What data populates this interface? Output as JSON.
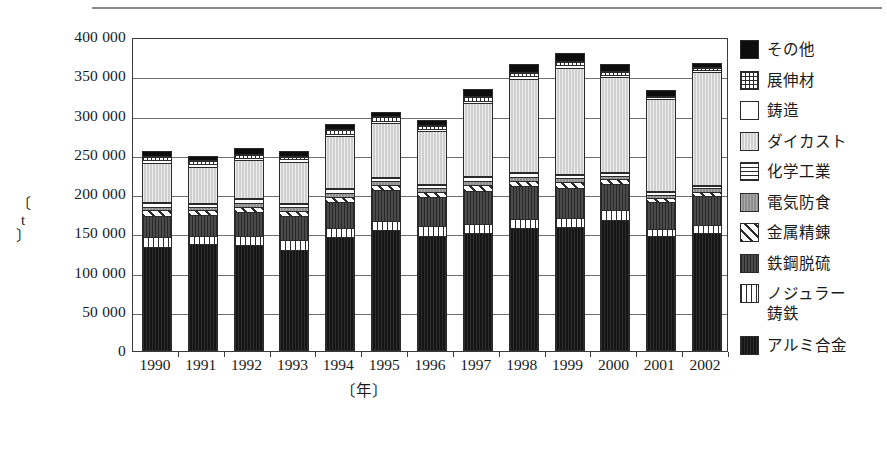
{
  "chart_data": {
    "type": "bar",
    "stacked": true,
    "title": "",
    "xlabel": "〔年〕",
    "ylabel": "〔t〕",
    "ylim": [
      0,
      400000
    ],
    "ytick_step": 50000,
    "ytick_labels": [
      "400 000",
      "350 000",
      "300 000",
      "250 000",
      "200 000",
      "150 000",
      "100 000",
      "50 000",
      "0"
    ],
    "ytick_values": [
      400000,
      350000,
      300000,
      250000,
      200000,
      150000,
      100000,
      50000,
      0
    ],
    "grid": true,
    "legend_position": "right",
    "categories": [
      "1990",
      "1991",
      "1992",
      "1993",
      "1994",
      "1995",
      "1996",
      "1997",
      "1998",
      "1999",
      "2000",
      "2001",
      "2002"
    ],
    "series": [
      {
        "name": "アルミ合金",
        "key": "alu",
        "fill": "f-alu",
        "color": "#151515",
        "values": [
          133000,
          136000,
          135000,
          129000,
          145000,
          154000,
          147000,
          150000,
          156000,
          158000,
          167000,
          147000,
          150000
        ]
      },
      {
        "name": "ノジュラー鋳鉄",
        "key": "nodular",
        "fill": "f-nodular",
        "color": "#ffffff",
        "values": [
          12000,
          11000,
          12000,
          12000,
          12000,
          12000,
          12000,
          12000,
          12000,
          12000,
          12000,
          9000,
          10000
        ]
      },
      {
        "name": "鉄鋼脱硫",
        "key": "desulf",
        "fill": "f-desulf",
        "color": "#4a4a4a",
        "values": [
          27000,
          26000,
          30000,
          31000,
          33000,
          39000,
          37000,
          42000,
          42000,
          38000,
          34000,
          34000,
          38000
        ]
      },
      {
        "name": "金属精錬",
        "key": "refine",
        "fill": "f-refine",
        "color": "#ffffff",
        "values": [
          7000,
          7000,
          7000,
          6000,
          6000,
          6000,
          6000,
          8000,
          7000,
          7000,
          6000,
          5000,
          5000
        ]
      },
      {
        "name": "電気防食",
        "key": "anticorr",
        "fill": "f-anticorr",
        "color": "#8e8e8e",
        "values": [
          5000,
          4000,
          5000,
          5000,
          5000,
          5000,
          5000,
          5000,
          5000,
          5000,
          4000,
          4000,
          4000
        ]
      },
      {
        "name": "化学工業",
        "key": "chem",
        "fill": "f-chem",
        "color": "#ffffff",
        "values": [
          6000,
          5000,
          6000,
          6000,
          6000,
          6000,
          6000,
          6000,
          6000,
          6000,
          5000,
          5000,
          5000
        ]
      },
      {
        "name": "ダイカスト",
        "key": "diecast",
        "fill": "f-diecast",
        "color": "#cfcfcf",
        "values": [
          50000,
          46000,
          48000,
          52000,
          67000,
          68000,
          67000,
          93000,
          119000,
          135000,
          121000,
          117000,
          144000
        ]
      },
      {
        "name": "鋳造",
        "key": "cast",
        "fill": "f-cast",
        "color": "#ffffff",
        "values": [
          3000,
          3000,
          3000,
          3000,
          3000,
          3000,
          3000,
          3000,
          3000,
          3000,
          3000,
          2000,
          2000
        ]
      },
      {
        "name": "展伸材",
        "key": "wrought",
        "fill": "f-wrought",
        "color": "#ffffff",
        "values": [
          5000,
          5000,
          5000,
          5000,
          6000,
          6000,
          5000,
          6000,
          6000,
          6000,
          5000,
          2000,
          4000
        ]
      },
      {
        "name": "その他",
        "key": "other",
        "fill": "f-other",
        "color": "#0d0d0d",
        "values": [
          7000,
          6000,
          7000,
          6000,
          6000,
          6000,
          6000,
          9000,
          9000,
          10000,
          9000,
          8000,
          5000
        ]
      }
    ],
    "totals": [
      255000,
      249000,
      258000,
      255000,
      289000,
      305000,
      294000,
      334000,
      365000,
      380000,
      366000,
      333000,
      367000
    ]
  },
  "legend": {
    "items": [
      {
        "label": "その他",
        "fill": "f-other"
      },
      {
        "label": "展伸材",
        "fill": "f-wrought"
      },
      {
        "label": "鋳造",
        "fill": "f-cast"
      },
      {
        "label": "ダイカスト",
        "fill": "f-diecast"
      },
      {
        "label": "化学工業",
        "fill": "f-chem"
      },
      {
        "label": "電気防食",
        "fill": "f-anticorr"
      },
      {
        "label": "金属精錬",
        "fill": "f-refine"
      },
      {
        "label": "鉄鋼脱硫",
        "fill": "f-desulf"
      },
      {
        "label": "ノジュラー\n鋳鉄",
        "fill": "f-nodular"
      },
      {
        "label": "アルミ合金",
        "fill": "f-alu"
      }
    ]
  }
}
